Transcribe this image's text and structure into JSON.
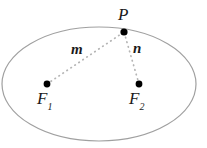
{
  "figure": {
    "background_color": "#ffffff",
    "width": 207,
    "height": 148,
    "ellipse": {
      "name": "ellipse-outline",
      "center_x": 99,
      "center_y": 84,
      "radius_x": 97,
      "radius_y": 57,
      "stroke_color": "#a0a0a0",
      "stroke_width": 1.2,
      "fill": "none"
    },
    "points": [
      {
        "id": "P",
        "label": "P",
        "x": 124,
        "y": 32,
        "radius": 3.4,
        "color": "#000000",
        "label_x": 124,
        "label_y": 15
      },
      {
        "id": "F1",
        "label": "F",
        "subscript": "1",
        "x": 47,
        "y": 84,
        "radius": 3.4,
        "color": "#000000",
        "label_x": 46,
        "label_y": 100
      },
      {
        "id": "F2",
        "label": "F",
        "subscript": "2",
        "x": 139,
        "y": 84,
        "radius": 3.4,
        "color": "#000000",
        "label_x": 139,
        "label_y": 100
      }
    ],
    "segments": [
      {
        "id": "m",
        "label": "m",
        "from": "F1",
        "to": "P",
        "x1": 47,
        "y1": 84,
        "x2": 124,
        "y2": 32,
        "style": "dotted",
        "stroke_color": "#b5b5b5",
        "stroke_width": 1.6,
        "label_x": 78,
        "label_y": 50
      },
      {
        "id": "n",
        "label": "n",
        "from": "F2",
        "to": "P",
        "x1": 139,
        "y1": 84,
        "x2": 124,
        "y2": 32,
        "style": "dotted",
        "stroke_color": "#b5b5b5",
        "stroke_width": 1.6,
        "label_x": 138,
        "label_y": 49
      }
    ]
  }
}
